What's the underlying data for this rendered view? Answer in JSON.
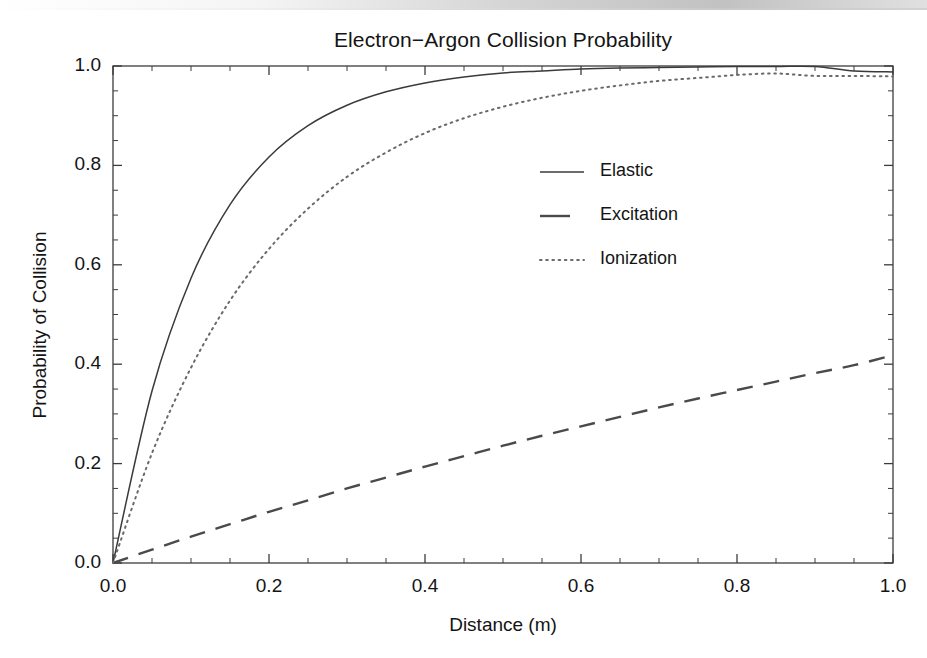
{
  "figure": {
    "title": "Electron−Argon Collision Probability",
    "xlabel": "Distance (m)",
    "ylabel": "Probability of Collision",
    "background": "#ffffff",
    "axis_color": "#3c3c3c",
    "text_color": "#141414"
  },
  "axes": {
    "x_ticks": [
      "0.0",
      "0.2",
      "0.4",
      "0.6",
      "0.8",
      "1.0"
    ],
    "y_ticks": [
      "0.0",
      "0.2",
      "0.4",
      "0.6",
      "0.8",
      "1.0"
    ]
  },
  "legend": {
    "entries": [
      {
        "label": "Elastic",
        "style": "solid"
      },
      {
        "label": "Excitation",
        "style": "dashed"
      },
      {
        "label": "Ionization",
        "style": "dotted"
      }
    ]
  },
  "chart_data": {
    "type": "line",
    "title": "Electron−Argon Collision Probability",
    "xlabel": "Distance (m)",
    "ylabel": "Probability of Collision",
    "xlim": [
      0.0,
      1.0
    ],
    "ylim": [
      0.0,
      1.0
    ],
    "grid": false,
    "legend_position": "center-right",
    "x": [
      0.0,
      0.05,
      0.1,
      0.15,
      0.2,
      0.25,
      0.3,
      0.35,
      0.4,
      0.45,
      0.5,
      0.55,
      0.6,
      0.65,
      0.7,
      0.75,
      0.8,
      0.85,
      0.9,
      0.95,
      1.0
    ],
    "series": [
      {
        "name": "Elastic",
        "style": "solid",
        "color": "#3a3a3a",
        "values": [
          0.0,
          0.346,
          0.573,
          0.721,
          0.817,
          0.88,
          0.921,
          0.948,
          0.966,
          0.978,
          0.986,
          0.99,
          0.994,
          0.996,
          0.997,
          0.998,
          0.999,
          0.999,
          0.999,
          0.99,
          0.988
        ]
      },
      {
        "name": "Excitation",
        "style": "dashed",
        "color": "#4a4a4a",
        "values": [
          0.0,
          0.027,
          0.053,
          0.078,
          0.103,
          0.126,
          0.15,
          0.172,
          0.194,
          0.215,
          0.236,
          0.256,
          0.275,
          0.294,
          0.313,
          0.331,
          0.348,
          0.365,
          0.382,
          0.398,
          0.418
        ]
      },
      {
        "name": "Ionization",
        "style": "dotted",
        "color": "#6a6a6a",
        "values": [
          0.0,
          0.221,
          0.393,
          0.528,
          0.632,
          0.713,
          0.777,
          0.826,
          0.865,
          0.895,
          0.918,
          0.936,
          0.95,
          0.961,
          0.97,
          0.976,
          0.982,
          0.985,
          0.98,
          0.98,
          0.979
        ]
      }
    ]
  }
}
